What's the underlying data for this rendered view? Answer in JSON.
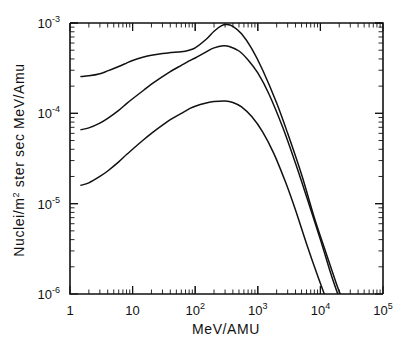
{
  "chart_data": {
    "type": "line",
    "title": "",
    "subtitle": "",
    "xlabel": "MeV/AMU",
    "ylabel": "Nuclei/m2 ster sec MeV/Amu",
    "ylabel_parts": {
      "pre": "Nuclei/m",
      "sup": "2",
      "post": " ster sec MeV/Amu"
    },
    "xscale": "log",
    "yscale": "log",
    "xlim": [
      1,
      100000
    ],
    "ylim": [
      1e-06,
      0.001
    ],
    "grid": false,
    "legend": null,
    "legend_position": "none",
    "annotations": [],
    "xticks": [
      {
        "value": 1,
        "mantissa": "1",
        "exponent": ""
      },
      {
        "value": 10,
        "mantissa": "10",
        "exponent": ""
      },
      {
        "value": 100,
        "mantissa": "10",
        "exponent": "2"
      },
      {
        "value": 1000,
        "mantissa": "10",
        "exponent": "3"
      },
      {
        "value": 10000,
        "mantissa": "10",
        "exponent": "4"
      },
      {
        "value": 100000,
        "mantissa": "10",
        "exponent": "5"
      }
    ],
    "yticks": [
      {
        "value": 0.001,
        "mantissa": "10",
        "exponent": "-3"
      },
      {
        "value": 0.0001,
        "mantissa": "10",
        "exponent": "-4"
      },
      {
        "value": 1e-05,
        "mantissa": "10",
        "exponent": "-5"
      },
      {
        "value": 1e-06,
        "mantissa": "10",
        "exponent": "-6"
      }
    ],
    "series": [
      {
        "name": "upper-curve",
        "points": [
          [
            1.5,
            0.000255
          ],
          [
            2,
            0.00026
          ],
          [
            3,
            0.000275
          ],
          [
            4,
            0.000295
          ],
          [
            6,
            0.00033
          ],
          [
            8,
            0.00036
          ],
          [
            10,
            0.000385
          ],
          [
            15,
            0.00042
          ],
          [
            20,
            0.00044
          ],
          [
            30,
            0.00046
          ],
          [
            40,
            0.00047
          ],
          [
            60,
            0.00048
          ],
          [
            80,
            0.0005
          ],
          [
            100,
            0.00053
          ],
          [
            150,
            0.00066
          ],
          [
            200,
            0.00081
          ],
          [
            260,
            0.00093
          ],
          [
            320,
            0.00096
          ],
          [
            400,
            0.00092
          ],
          [
            550,
            0.00076
          ],
          [
            800,
            0.00052
          ],
          [
            1200,
            0.0003
          ],
          [
            2000,
            0.00013
          ],
          [
            3000,
            6e-05
          ],
          [
            5000,
            2.1e-05
          ],
          [
            8000,
            7e-06
          ],
          [
            12000,
            3e-06
          ],
          [
            18000,
            1.3e-06
          ],
          [
            22000,
            9e-07
          ]
        ]
      },
      {
        "name": "middle-curve",
        "points": [
          [
            1.5,
            6.6e-05
          ],
          [
            2,
            6.9e-05
          ],
          [
            3,
            7.8e-05
          ],
          [
            4,
            8.8e-05
          ],
          [
            6,
            0.000108
          ],
          [
            8,
            0.000128
          ],
          [
            10,
            0.000145
          ],
          [
            15,
            0.00018
          ],
          [
            20,
            0.00021
          ],
          [
            30,
            0.000255
          ],
          [
            40,
            0.00029
          ],
          [
            60,
            0.00034
          ],
          [
            80,
            0.00038
          ],
          [
            100,
            0.00041
          ],
          [
            150,
            0.00048
          ],
          [
            200,
            0.00053
          ],
          [
            280,
            0.00056
          ],
          [
            350,
            0.00055
          ],
          [
            500,
            0.00049
          ],
          [
            700,
            0.00039
          ],
          [
            1000,
            0.00028
          ],
          [
            1500,
            0.000165
          ],
          [
            2500,
            7e-05
          ],
          [
            4000,
            2.8e-05
          ],
          [
            6000,
            1.2e-05
          ],
          [
            10000,
            4e-06
          ],
          [
            15000,
            1.6e-06
          ],
          [
            20000,
            9e-07
          ]
        ]
      },
      {
        "name": "lower-curve",
        "points": [
          [
            1.5,
            1.6e-05
          ],
          [
            2,
            1.7e-05
          ],
          [
            3,
            2e-05
          ],
          [
            4,
            2.3e-05
          ],
          [
            6,
            2.9e-05
          ],
          [
            8,
            3.5e-05
          ],
          [
            10,
            4e-05
          ],
          [
            15,
            5.1e-05
          ],
          [
            20,
            6e-05
          ],
          [
            30,
            7.4e-05
          ],
          [
            40,
            8.5e-05
          ],
          [
            60,
            0.0001
          ],
          [
            80,
            0.000112
          ],
          [
            100,
            0.00012
          ],
          [
            150,
            0.00013
          ],
          [
            200,
            0.000135
          ],
          [
            300,
            0.000137
          ],
          [
            400,
            0.000132
          ],
          [
            550,
            0.000118
          ],
          [
            800,
            9.2e-05
          ],
          [
            1200,
            6.2e-05
          ],
          [
            1800,
            3.6e-05
          ],
          [
            2800,
            1.7e-05
          ],
          [
            4000,
            8.5e-06
          ],
          [
            6000,
            3.6e-06
          ],
          [
            9000,
            1.6e-06
          ],
          [
            13000,
            8e-07
          ]
        ]
      }
    ]
  },
  "figure": {
    "background_color": "#ffffff",
    "line_color": "#111111"
  }
}
